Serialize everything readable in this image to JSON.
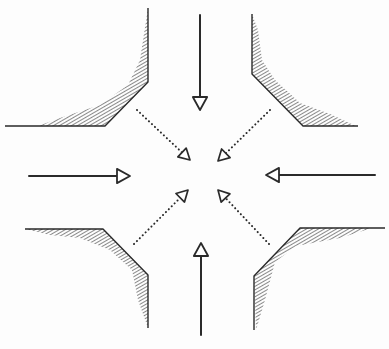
{
  "diagram": {
    "title": "Four-way intersection traffic flow sketch",
    "colors": {
      "ink": "#2a2a2a",
      "hatch": "#3a3a3a",
      "background": "#fdfdfd"
    },
    "center": [
      196,
      176
    ],
    "curbs": [
      {
        "id": "northwest",
        "outline": [
          [
            5,
            126
          ],
          [
            105,
            126
          ],
          [
            148,
            82
          ],
          [
            148,
            8
          ]
        ],
        "hatch_poly": [
          [
            38,
            126
          ],
          [
            105,
            126
          ],
          [
            148,
            82
          ],
          [
            148,
            8
          ],
          [
            140,
            60
          ],
          [
            128,
            85
          ],
          [
            100,
            105
          ],
          [
            60,
            118
          ]
        ]
      },
      {
        "id": "northeast",
        "outline": [
          [
            252,
            14
          ],
          [
            252,
            74
          ],
          [
            303,
            126
          ],
          [
            358,
            126
          ]
        ],
        "hatch_poly": [
          [
            252,
            14
          ],
          [
            252,
            74
          ],
          [
            303,
            126
          ],
          [
            356,
            126
          ],
          [
            330,
            114
          ],
          [
            300,
            103
          ],
          [
            275,
            80
          ],
          [
            262,
            60
          ],
          [
            258,
            30
          ]
        ]
      },
      {
        "id": "southwest",
        "outline": [
          [
            25,
            229
          ],
          [
            103,
            229
          ],
          [
            148,
            275
          ],
          [
            148,
            328
          ]
        ],
        "hatch_poly": [
          [
            25,
            229
          ],
          [
            103,
            229
          ],
          [
            148,
            275
          ],
          [
            148,
            328
          ],
          [
            138,
            300
          ],
          [
            132,
            270
          ],
          [
            110,
            250
          ],
          [
            80,
            238
          ],
          [
            50,
            235
          ]
        ]
      },
      {
        "id": "southeast",
        "outline": [
          [
            254,
            330
          ],
          [
            254,
            276
          ],
          [
            300,
            228
          ],
          [
            385,
            228
          ]
        ],
        "hatch_poly": [
          [
            256,
            330
          ],
          [
            254,
            276
          ],
          [
            300,
            228
          ],
          [
            372,
            228
          ],
          [
            340,
            238
          ],
          [
            296,
            246
          ],
          [
            275,
            262
          ],
          [
            265,
            300
          ]
        ]
      }
    ],
    "solid_arrows": [
      {
        "id": "eastbound",
        "from": [
          29,
          176
        ],
        "to": [
          130,
          176
        ],
        "direction": "east"
      },
      {
        "id": "westbound",
        "from": [
          375,
          175
        ],
        "to": [
          266,
          175
        ],
        "direction": "west"
      },
      {
        "id": "southbound",
        "from": [
          200,
          15
        ],
        "to": [
          200,
          110
        ],
        "direction": "south"
      },
      {
        "id": "northbound",
        "from": [
          201,
          335
        ],
        "to": [
          201,
          243
        ],
        "direction": "north"
      }
    ],
    "dotted_arrows": [
      {
        "id": "from-northwest",
        "from": [
          137,
          110
        ],
        "to": [
          190,
          160
        ]
      },
      {
        "id": "from-northeast",
        "from": [
          270,
          110
        ],
        "to": [
          218,
          161
        ]
      },
      {
        "id": "from-southwest",
        "from": [
          134,
          244
        ],
        "to": [
          188,
          190
        ]
      },
      {
        "id": "from-southeast",
        "from": [
          269,
          244
        ],
        "to": [
          218,
          190
        ]
      }
    ]
  }
}
